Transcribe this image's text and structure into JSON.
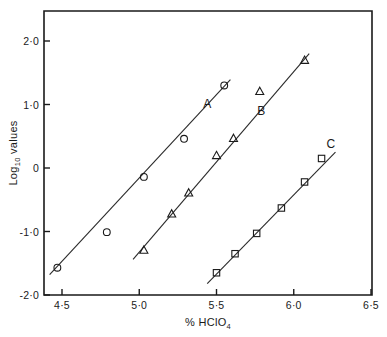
{
  "chart_data": {
    "type": "scatter",
    "title": "",
    "xlabel": "% HClO₄",
    "xlabel_parts": {
      "main": "% HClO",
      "sub": "4"
    },
    "ylabel": "Log₁₀ values",
    "ylabel_parts": {
      "pre": "Log",
      "sub": "10",
      "post": " values"
    },
    "xlim": [
      4.3,
      6.5
    ],
    "ylim": [
      -2.0,
      2.3
    ],
    "grid": false,
    "legend": "inline-labels",
    "xticks": [
      4.5,
      5.0,
      5.5,
      6.0,
      6.5
    ],
    "xticklabels": [
      "4·5",
      "5·0",
      "5·5",
      "6·0",
      "6·5"
    ],
    "yticks": [
      2.0,
      1.0,
      0.0,
      -1.0,
      -2.0
    ],
    "yticklabels": [
      "2·0",
      "1·0",
      "0",
      "-1·0",
      "-2·0"
    ],
    "series": [
      {
        "name": "A",
        "marker": "circle",
        "label": "A",
        "label_x": 5.44,
        "label_y": 0.95,
        "line": [
          [
            4.42,
            -1.68
          ],
          [
            5.59,
            1.39
          ]
        ],
        "x": [
          4.47,
          4.79,
          5.03,
          5.29,
          5.55
        ],
        "y": [
          -1.57,
          -1.01,
          -0.14,
          0.46,
          1.3
        ]
      },
      {
        "name": "B",
        "marker": "triangle",
        "label": "B",
        "label_x": 5.79,
        "label_y": 0.84,
        "line": [
          [
            4.96,
            -1.44
          ],
          [
            6.1,
            1.8
          ]
        ],
        "x": [
          5.03,
          5.21,
          5.32,
          5.5,
          5.61,
          5.78,
          6.07
        ],
        "y": [
          -1.29,
          -0.72,
          -0.39,
          0.2,
          0.47,
          1.21,
          1.7
        ]
      },
      {
        "name": "C",
        "marker": "square",
        "label": "C",
        "label_x": 6.24,
        "label_y": 0.32,
        "line": [
          [
            5.44,
            -1.82
          ],
          [
            6.27,
            0.25
          ]
        ],
        "x": [
          5.5,
          5.62,
          5.76,
          5.92,
          6.07,
          6.18
        ],
        "y": [
          -1.65,
          -1.35,
          -1.03,
          -0.63,
          -0.22,
          0.15
        ]
      }
    ]
  }
}
